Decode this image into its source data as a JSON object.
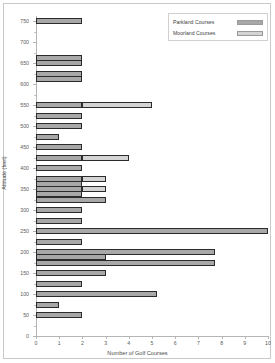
{
  "chart_data": {
    "type": "bar",
    "orientation": "horizontal",
    "stacked": true,
    "title": "",
    "xlabel": "Number of Golf Courses",
    "ylabel": "Altitude (feet)",
    "xlim": [
      0,
      10
    ],
    "ylim": [
      0,
      762
    ],
    "xticks": [
      "0",
      "1",
      "2",
      "3",
      "4",
      "5",
      "6",
      "7",
      "8",
      "9",
      "10"
    ],
    "xtick_values": [
      0,
      1,
      2,
      3,
      4,
      5,
      6,
      7,
      8,
      9,
      10
    ],
    "yticks": [
      "0",
      "50",
      "100",
      "150",
      "200",
      "250",
      "300",
      "350",
      "400",
      "450",
      "500",
      "550",
      "600",
      "650",
      "700",
      "750"
    ],
    "ytick_values": [
      0,
      50,
      100,
      150,
      200,
      250,
      300,
      350,
      400,
      450,
      500,
      550,
      600,
      650,
      700,
      750
    ],
    "grid": false,
    "legend_position": "top-right",
    "categories": [
      750,
      662,
      650,
      625,
      612,
      550,
      525,
      500,
      475,
      450,
      425,
      400,
      375,
      362,
      350,
      337,
      325,
      300,
      275,
      250,
      225,
      200,
      188,
      175,
      150,
      125,
      100,
      75,
      50,
      25
    ],
    "series": [
      {
        "name": "Parkland Courses",
        "color": "#a8a8a8",
        "values": [
          2,
          2,
          2,
          2,
          2,
          2,
          2,
          2,
          1,
          2,
          2,
          2,
          2,
          2,
          2,
          2,
          3,
          2,
          2,
          10,
          2,
          7.7,
          3,
          7.7,
          3,
          2,
          5.2,
          1,
          2,
          0
        ]
      },
      {
        "name": "Moorland Courses",
        "color": "#d4d4d4",
        "values": [
          0,
          0,
          0,
          0,
          0,
          3,
          0,
          0,
          0,
          0,
          2,
          0,
          1,
          0,
          1,
          0,
          0,
          0,
          0,
          0,
          0,
          0,
          0,
          0,
          0,
          0,
          0,
          0,
          0,
          0
        ]
      }
    ],
    "bars": [
      {
        "altitude": 750,
        "parkland": 2,
        "moorland": 0
      },
      {
        "altitude": 662,
        "parkland": 2,
        "moorland": 0
      },
      {
        "altitude": 650,
        "parkland": 2,
        "moorland": 0
      },
      {
        "altitude": 625,
        "parkland": 2,
        "moorland": 0
      },
      {
        "altitude": 612,
        "parkland": 2,
        "moorland": 0
      },
      {
        "altitude": 550,
        "parkland": 2,
        "moorland": 3
      },
      {
        "altitude": 525,
        "parkland": 2,
        "moorland": 0
      },
      {
        "altitude": 500,
        "parkland": 2,
        "moorland": 0
      },
      {
        "altitude": 475,
        "parkland": 1,
        "moorland": 0
      },
      {
        "altitude": 450,
        "parkland": 2,
        "moorland": 0
      },
      {
        "altitude": 425,
        "parkland": 2,
        "moorland": 2
      },
      {
        "altitude": 400,
        "parkland": 2,
        "moorland": 0
      },
      {
        "altitude": 375,
        "parkland": 2,
        "moorland": 1
      },
      {
        "altitude": 362,
        "parkland": 2,
        "moorland": 0
      },
      {
        "altitude": 350,
        "parkland": 2,
        "moorland": 1
      },
      {
        "altitude": 337,
        "parkland": 2,
        "moorland": 0
      },
      {
        "altitude": 325,
        "parkland": 3,
        "moorland": 0
      },
      {
        "altitude": 300,
        "parkland": 2,
        "moorland": 0
      },
      {
        "altitude": 275,
        "parkland": 2,
        "moorland": 0
      },
      {
        "altitude": 250,
        "parkland": 10,
        "moorland": 0
      },
      {
        "altitude": 225,
        "parkland": 2,
        "moorland": 0
      },
      {
        "altitude": 200,
        "parkland": 7.7,
        "moorland": 0
      },
      {
        "altitude": 188,
        "parkland": 3,
        "moorland": 0
      },
      {
        "altitude": 175,
        "parkland": 7.7,
        "moorland": 0
      },
      {
        "altitude": 150,
        "parkland": 3,
        "moorland": 0
      },
      {
        "altitude": 125,
        "parkland": 2,
        "moorland": 0
      },
      {
        "altitude": 100,
        "parkland": 5.2,
        "moorland": 0
      },
      {
        "altitude": 75,
        "parkland": 1,
        "moorland": 0
      },
      {
        "altitude": 50,
        "parkland": 2,
        "moorland": 0
      }
    ]
  },
  "legend": {
    "items": [
      {
        "label": "Parkland Courses",
        "color": "#a8a8a8"
      },
      {
        "label": "Moorland Courses",
        "color": "#d4d4d4"
      }
    ]
  },
  "axes": {
    "x_title": "Number of Golf Courses",
    "y_title": "Altitude (feet)"
  }
}
